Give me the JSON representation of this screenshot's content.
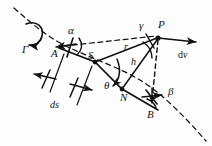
{
  "figure": {
    "type": "mechanics-vector-diagram",
    "background_color": "#fdfdfd",
    "stroke_color": "#111111"
  },
  "labels": {
    "gamma_capital": "Γ",
    "alpha": "α",
    "beta": "β",
    "gamma": "γ",
    "theta": "θ",
    "point_a": "A",
    "point_s": "S",
    "point_n": "N",
    "point_p": "P",
    "point_b": "B",
    "radius_r": "r",
    "height_h": "h",
    "arc_ds": "ds",
    "velocity_dv_prefix": "d",
    "velocity_dv_symbol": "v"
  },
  "points": [
    {
      "name": "A",
      "x": 63,
      "y": 48,
      "marker": "none"
    },
    {
      "name": "S",
      "x": 95,
      "y": 62,
      "marker": "dot"
    },
    {
      "name": "N",
      "x": 122,
      "y": 89,
      "marker": "dot"
    },
    {
      "name": "P",
      "x": 158,
      "y": 38,
      "marker": "dot"
    },
    {
      "name": "B",
      "x": 152,
      "y": 105,
      "marker": "none"
    }
  ],
  "annotations": {
    "rotation_arrow": "circular-rotation-arrow",
    "trajectory": "dashed-curve",
    "dimension_ds": "ds-dimension-bracket",
    "velocity_vector": "dv-arrow-right"
  }
}
